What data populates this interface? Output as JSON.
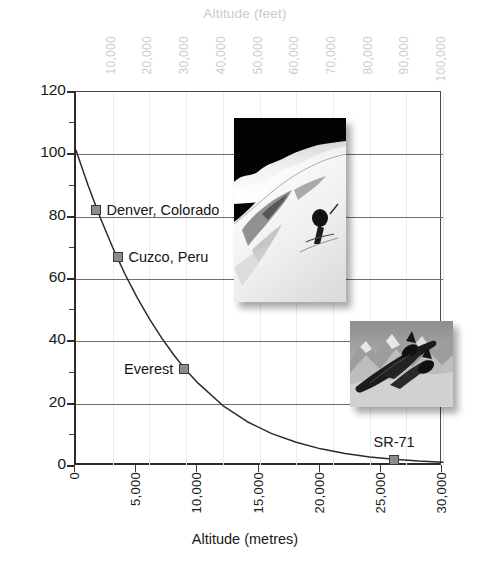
{
  "chart_data": {
    "type": "line",
    "title": "",
    "xlabel": "Altitude (metres)",
    "ylabel": "Barometric pressure (kPa)",
    "secondary_xlabel": "Altitude (feet)",
    "xlim": [
      0,
      30000
    ],
    "ylim": [
      0,
      120
    ],
    "secondary_xlim": [
      0,
      100000
    ],
    "xticks": [
      "0",
      "5,000",
      "10,000",
      "15,000",
      "20,000",
      "25,000",
      "30,000"
    ],
    "xtick_values": [
      0,
      5000,
      10000,
      15000,
      20000,
      25000,
      30000
    ],
    "yticks": [
      "0",
      "20",
      "40",
      "60",
      "80",
      "100",
      "120"
    ],
    "ytick_values": [
      0,
      20,
      40,
      60,
      80,
      100,
      120
    ],
    "y_minor_ticks": [
      10,
      30,
      50,
      70,
      90,
      110
    ],
    "secondary_xticks": [
      "10,000",
      "20,000",
      "30,000",
      "40,000",
      "50,000",
      "60,000",
      "70,000",
      "80,000",
      "90,000",
      "100,000"
    ],
    "secondary_xtick_values": [
      10000,
      20000,
      30000,
      40000,
      50000,
      60000,
      70000,
      80000,
      90000,
      100000
    ],
    "grid": "horizontal-major-and-faint-vertical",
    "legend": "none",
    "series": [
      {
        "name": "Barometric pressure vs altitude",
        "x": [
          0,
          1000,
          2000,
          3000,
          4000,
          5000,
          6000,
          7000,
          8000,
          8850,
          10000,
          12000,
          14000,
          16000,
          18000,
          20000,
          22000,
          24000,
          26000,
          28000,
          30000
        ],
        "y": [
          101.3,
          89.9,
          79.5,
          70.1,
          61.6,
          54.0,
          47.2,
          41.1,
          35.6,
          31.4,
          26.5,
          19.4,
          14.2,
          10.4,
          7.6,
          5.5,
          4.0,
          2.9,
          2.2,
          1.6,
          1.2
        ]
      }
    ],
    "annotated_points": [
      {
        "label": "Denver, Colorado",
        "x": 1600,
        "y": 82,
        "label_side": "right"
      },
      {
        "label": "Cuzco, Peru",
        "x": 3400,
        "y": 67,
        "label_side": "right"
      },
      {
        "label": "Everest",
        "x": 8850,
        "y": 31,
        "label_side": "left"
      },
      {
        "label": "SR-71",
        "x": 26000,
        "y": 2,
        "label_side": "above"
      }
    ],
    "images": [
      {
        "name": "everest-summit-photo",
        "alt": "Black and white photo of the Mount Everest summit with a climber and dark sky"
      },
      {
        "name": "sr71-blackbird-photo",
        "alt": "Black and white photo of an SR-71 Blackbird aircraft flying over mountains"
      }
    ]
  },
  "colors": {
    "axis": "#2b2b2b",
    "gridline": "#6e6e6e",
    "faint_gridline": "#ededed",
    "secondary_axis_text": "#cdcdcd",
    "marker_fill": "#8c8c8c",
    "marker_border": "#3a3a3a",
    "curve": "#2b2b2b",
    "text": "#1a1a1a",
    "background": "#ffffff"
  }
}
